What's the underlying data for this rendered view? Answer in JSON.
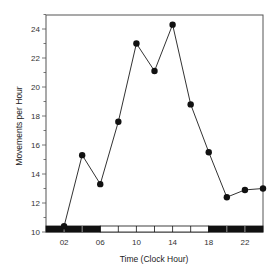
{
  "chart_data": {
    "type": "line",
    "title": "",
    "xlabel": "Time (Clock Hour)",
    "ylabel": "Movements per Hour",
    "x": [
      2,
      4,
      6,
      8,
      10,
      12,
      14,
      16,
      18,
      20,
      22,
      24
    ],
    "series": [
      {
        "name": "Movements per Hour",
        "values": [
          10.4,
          15.3,
          13.3,
          17.6,
          23.0,
          21.1,
          24.3,
          18.8,
          15.5,
          12.4,
          12.9,
          13.0
        ]
      }
    ],
    "xlim": [
      0,
      24
    ],
    "ylim": [
      10,
      25
    ],
    "x_tick_labels": [
      "02",
      "06",
      "10",
      "14",
      "18",
      "22"
    ],
    "x_tick_values": [
      2,
      6,
      10,
      14,
      18,
      22
    ],
    "y_tick_labels": [
      "10",
      "12",
      "14",
      "16",
      "18",
      "20",
      "22",
      "24"
    ],
    "y_tick_values": [
      10,
      12,
      14,
      16,
      18,
      20,
      22,
      24
    ],
    "grid": false,
    "legend": "none",
    "light_dark_bar": {
      "segments": [
        {
          "start": 0,
          "end": 6,
          "phase": "dark"
        },
        {
          "start": 6,
          "end": 18,
          "phase": "light"
        },
        {
          "start": 18,
          "end": 24,
          "phase": "dark"
        }
      ],
      "division_every_hours": 2
    },
    "colors": {
      "line": "#333333",
      "marker": "#111111",
      "dark_bar": "#111111",
      "light_bar": "#ffffff",
      "frame": "#555555"
    }
  }
}
